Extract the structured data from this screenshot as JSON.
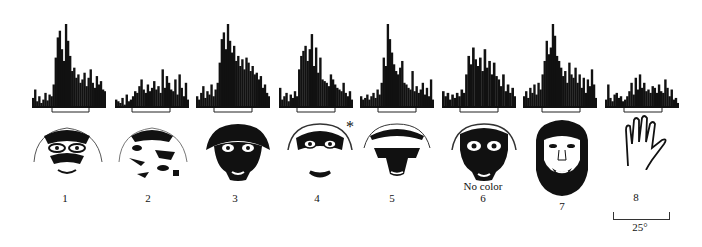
{
  "figure": {
    "panels": [
      {
        "id": "1",
        "label": "1",
        "stimulus": "monkey face (intact)",
        "bars": [
          12,
          22,
          8,
          14,
          6,
          10,
          18,
          9,
          16,
          14,
          28,
          60,
          84,
          92,
          70,
          56,
          100,
          80,
          62,
          44,
          48,
          36,
          40,
          30,
          34,
          42,
          26,
          36,
          46,
          30,
          24,
          38,
          28,
          32,
          22,
          20
        ],
        "left": 32,
        "stim_start": 52,
        "stim_end": 89
      },
      {
        "id": "2",
        "label": "2",
        "stimulus": "monkey face (scrambled)",
        "bars": [
          10,
          8,
          6,
          12,
          4,
          16,
          8,
          10,
          14,
          20,
          18,
          26,
          34,
          22,
          18,
          28,
          20,
          24,
          32,
          22,
          26,
          18,
          46,
          24,
          38,
          30,
          22,
          20,
          34,
          16,
          40,
          24,
          14,
          30,
          10
        ],
        "left": 115,
        "stim_start": 132,
        "stim_end": 170
      },
      {
        "id": "3",
        "label": "3",
        "stimulus": "monkey face (high contrast)",
        "bars": [
          14,
          10,
          18,
          26,
          12,
          20,
          16,
          28,
          14,
          22,
          30,
          54,
          82,
          90,
          70,
          100,
          80,
          66,
          74,
          56,
          62,
          50,
          58,
          46,
          60,
          54,
          44,
          50,
          40,
          42,
          34,
          38,
          24,
          28,
          18,
          14
        ],
        "left": 196,
        "stim_start": 214,
        "stim_end": 252
      },
      {
        "id": "4",
        "label": "4",
        "stimulus": "monkey face without mouth",
        "bars": [
          24,
          10,
          14,
          18,
          8,
          16,
          12,
          20,
          14,
          46,
          62,
          68,
          74,
          56,
          70,
          88,
          50,
          72,
          42,
          60,
          34,
          32,
          30,
          26,
          40,
          34,
          28,
          24,
          22,
          20,
          30,
          18,
          14,
          20,
          10
        ],
        "left": 279,
        "stim_start": 297,
        "stim_end": 335
      },
      {
        "id": "5",
        "label": "5",
        "stimulus": "monkey face without eyes",
        "bars": [
          14,
          10,
          12,
          16,
          10,
          14,
          18,
          12,
          22,
          16,
          30,
          60,
          50,
          100,
          82,
          66,
          52,
          44,
          40,
          48,
          56,
          30,
          28,
          24,
          22,
          44,
          20,
          26,
          18,
          22,
          30,
          16,
          24,
          14,
          34,
          10
        ],
        "left": 360,
        "stim_start": 378,
        "stim_end": 416
      },
      {
        "id": "6",
        "label": "6",
        "sub_label": "No color",
        "stimulus": "monkey face, no color",
        "bars": [
          20,
          14,
          18,
          10,
          16,
          12,
          18,
          14,
          22,
          18,
          40,
          62,
          52,
          72,
          58,
          50,
          60,
          44,
          70,
          48,
          56,
          40,
          54,
          38,
          34,
          26,
          40,
          20,
          28,
          18,
          24,
          14
        ],
        "left": 442,
        "stim_start": 460,
        "stim_end": 498
      },
      {
        "id": "7",
        "label": "7",
        "stimulus": "human face",
        "bars": [
          14,
          20,
          12,
          24,
          18,
          28,
          16,
          30,
          22,
          40,
          56,
          80,
          64,
          72,
          100,
          86,
          62,
          56,
          48,
          38,
          44,
          30,
          54,
          40,
          36,
          48,
          30,
          40,
          24,
          36,
          18,
          34,
          26,
          46,
          28,
          12
        ],
        "left": 523,
        "stim_start": 542,
        "stim_end": 580
      },
      {
        "id": "8",
        "label": "8",
        "stimulus": "hand",
        "bars": [
          10,
          28,
          12,
          8,
          16,
          18,
          12,
          14,
          8,
          10,
          14,
          20,
          30,
          16,
          36,
          22,
          40,
          24,
          30,
          20,
          22,
          18,
          26,
          24,
          18,
          28,
          20,
          18,
          34,
          24,
          14,
          22,
          10,
          12,
          6
        ],
        "left": 605,
        "stim_start": 624,
        "stim_end": 662
      }
    ],
    "scale_bar": {
      "label": "25°"
    },
    "annotation_star": "*"
  }
}
